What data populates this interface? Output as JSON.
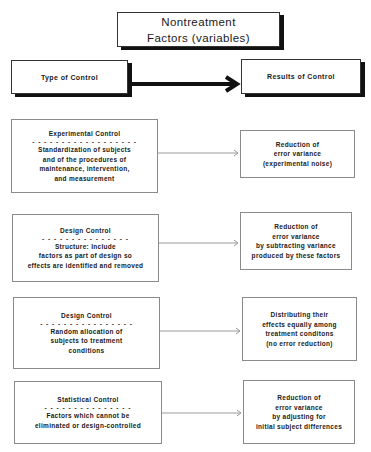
{
  "title": {
    "line1": "Nontreatment",
    "line2": "Factors (variables)"
  },
  "headers": {
    "left": "Type of Control",
    "right": "Results of Control"
  },
  "rows": [
    {
      "control": "Experimental Control",
      "dashes": "- - - - - - - - - - - - - - - - - -",
      "description": [
        "Standardization of subjects",
        "and of the procedures of",
        "maintenance, intervention,",
        "and measurement"
      ],
      "result": [
        "Reduction of",
        "error variance",
        "(experimental noise)"
      ]
    },
    {
      "control": "Design Control",
      "dashes": "- - - - - - - - - - - - - - -",
      "description": [
        "Structure:  Include",
        "factors as part of design so",
        "effects are identified and removed"
      ],
      "result": [
        "Reduction of",
        "error variance",
        "by subtracting variance",
        "produced by these factors"
      ]
    },
    {
      "control": "Design Control",
      "dashes": "- - - - - - - - - - - - - - - -",
      "description": [
        "Random allocation of",
        "subjects to treatment",
        "conditions"
      ],
      "result": [
        "Distributing their",
        "effects equally among",
        "treatment conditons",
        "(no error reduction)"
      ]
    },
    {
      "control": "Statistical Control",
      "dashes": "- - - - - - - - - - - - - - -",
      "description": [
        "Factors which cannot be",
        "eliminated or design-controlled"
      ],
      "result": [
        "Reduction of",
        "error variance",
        "by adjusting for",
        "initial subject differences"
      ]
    }
  ]
}
